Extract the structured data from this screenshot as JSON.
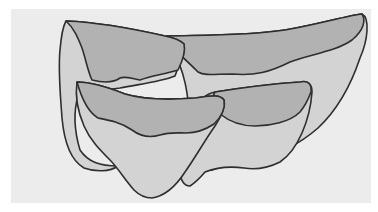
{
  "figure": {
    "colors": {
      "frame": "#ffffff",
      "panel": "#ececec",
      "body_fill": "#d3d3d3",
      "band_fill": "#b2b2b2",
      "outline": "#2e2e2e"
    },
    "shapes": [
      {
        "name": "back-left"
      },
      {
        "name": "back-right"
      },
      {
        "name": "front-left"
      },
      {
        "name": "front-right"
      }
    ]
  }
}
